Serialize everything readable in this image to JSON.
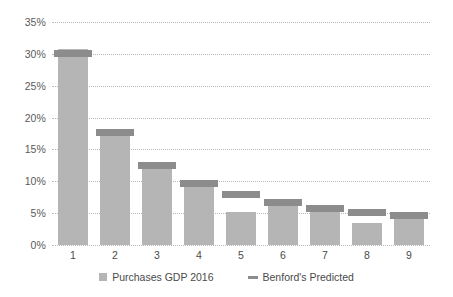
{
  "chart_data": {
    "type": "bar",
    "title": "",
    "subtitle": "",
    "xlabel": "",
    "ylabel": "",
    "ylim": [
      0,
      35
    ],
    "ytick_labels": [
      "0%",
      "5%",
      "10%",
      "15%",
      "20%",
      "25%",
      "30%",
      "35%"
    ],
    "ytick_values": [
      0,
      5,
      10,
      15,
      20,
      25,
      30,
      35
    ],
    "grid": true,
    "legend_position": "bottom-center",
    "categories": [
      "1",
      "2",
      "3",
      "4",
      "5",
      "6",
      "7",
      "8",
      "9"
    ],
    "series": [
      {
        "name": "Purchases GDP 2016",
        "type": "bar",
        "color": "#b5b5b5",
        "values": [
          30.8,
          17.3,
          11.9,
          9.2,
          5.2,
          6.3,
          5.4,
          3.4,
          4.7
        ]
      },
      {
        "name": "Benford's Predicted",
        "type": "marker",
        "color": "#8c8c8c",
        "values": [
          30.1,
          17.6,
          12.5,
          9.7,
          7.9,
          6.7,
          5.8,
          5.1,
          4.6
        ]
      }
    ]
  },
  "legend": {
    "items": [
      {
        "label": "Purchases GDP 2016",
        "marker": "square-swatch"
      },
      {
        "label": "Benford's Predicted",
        "marker": "dash-swatch"
      }
    ]
  }
}
